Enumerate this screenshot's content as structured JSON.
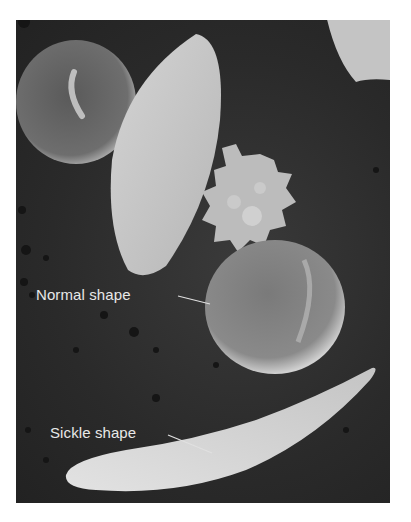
{
  "figure": {
    "labels": [
      {
        "id": "normal",
        "text": "Normal shape"
      },
      {
        "id": "sickle",
        "text": "Sickle shape"
      }
    ],
    "colors": {
      "background": "#2a2a2a",
      "cell": "#c8c8c8",
      "label_text": "#e8e8e8",
      "page": "#ffffff"
    }
  }
}
